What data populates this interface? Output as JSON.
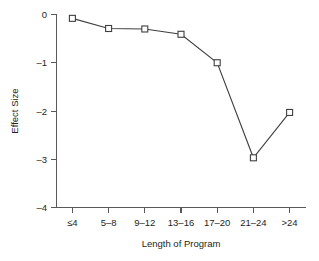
{
  "chart_data": {
    "type": "line",
    "title": "",
    "subtitle": "",
    "xlabel": "Length of Program",
    "ylabel": "Effect Size",
    "categories": [
      "≤4",
      "5–8",
      "9–12",
      "13–16",
      "17–20",
      "21–24",
      ">24"
    ],
    "values": [
      -0.08,
      -0.29,
      -0.3,
      -0.41,
      -1.0,
      -2.97,
      -2.03
    ],
    "ylim": [
      -4,
      0
    ],
    "yticks": [
      0,
      -1,
      -2,
      -3,
      -4
    ],
    "ytick_labels": [
      "0",
      "–1",
      "–2",
      "–3",
      "–4"
    ],
    "grid": false,
    "legend": false,
    "legend_position": "none",
    "marker": "open-square",
    "line_color": "#3f3f41",
    "marker_fill": "#ffffff",
    "axis_color": "#58595b",
    "background": "#ffffff"
  },
  "axes": {
    "y_title": "Effect Size",
    "x_title": "Length of Program"
  }
}
